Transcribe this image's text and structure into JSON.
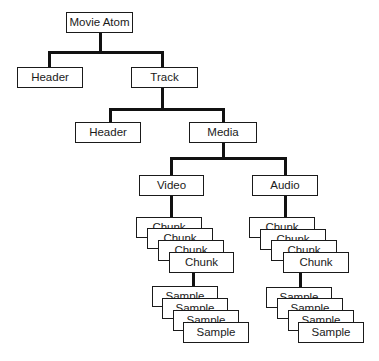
{
  "diagram": {
    "type": "tree",
    "root": {
      "label": "Movie Atom",
      "children": [
        {
          "label": "Header"
        },
        {
          "label": "Track",
          "children": [
            {
              "label": "Header"
            },
            {
              "label": "Media",
              "children": [
                {
                  "label": "Video",
                  "chunks": [
                    "Chunk",
                    "Chunk",
                    "Chunk",
                    "Chunk"
                  ],
                  "samples": [
                    "Sample",
                    "Sample",
                    "Sample",
                    "Sample"
                  ]
                },
                {
                  "label": "Audio",
                  "chunks": [
                    "Chunk",
                    "Chunk",
                    "Chunk",
                    "Chunk"
                  ],
                  "samples": [
                    "Sample",
                    "Sample",
                    "Sample",
                    "Sample"
                  ]
                }
              ]
            }
          ]
        }
      ]
    }
  },
  "nodes": {
    "movie_atom": "Movie Atom",
    "movie_header": "Header",
    "track": "Track",
    "track_header": "Header",
    "media": "Media",
    "video": "Video",
    "audio": "Audio",
    "video_chunks": [
      "Chunk",
      "Chunk",
      "Chunk",
      "Chunk"
    ],
    "video_samples": [
      "Sample",
      "Sample",
      "Sample",
      "Sample"
    ],
    "audio_chunks": [
      "Chunk",
      "Chunk",
      "Chunk",
      "Chunk"
    ],
    "audio_samples": [
      "Sample",
      "Sample",
      "Sample",
      "Sample"
    ]
  },
  "colors": {
    "line": "#111111",
    "box_border": "#1a1a1a",
    "background": "#ffffff"
  }
}
